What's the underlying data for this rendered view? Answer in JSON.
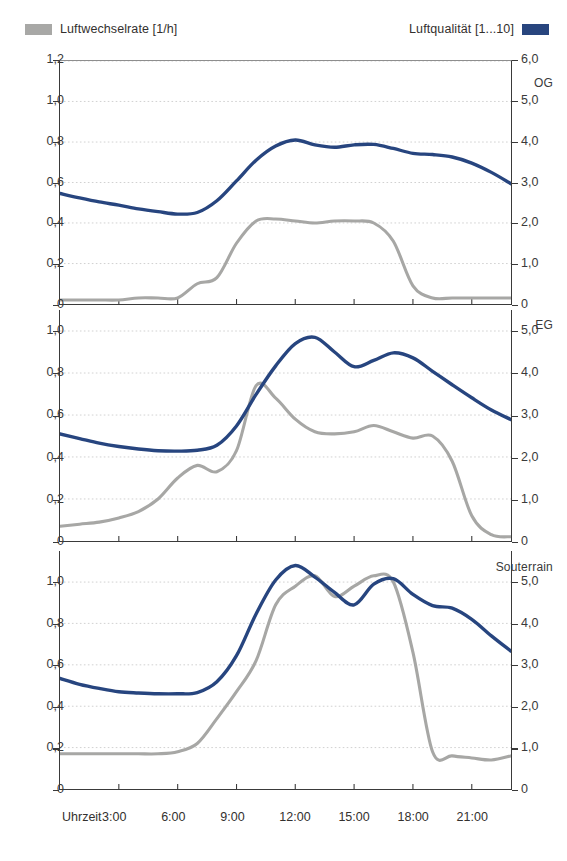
{
  "legend": {
    "left": {
      "label": "Luftwechselrate [1/h]",
      "color": "#a8a8a6",
      "swatch_name": "grey-swatch"
    },
    "right": {
      "label": "Luftqualität [1...10]",
      "color": "#28457e",
      "swatch_name": "blue-swatch"
    }
  },
  "axis": {
    "x_title": "Uhrzeit",
    "x_ticklabels": [
      "3:00",
      "6:00",
      "9:00",
      "12:00",
      "15:00",
      "18:00",
      "21:00"
    ],
    "x_tickvalues": [
      3,
      6,
      9,
      12,
      15,
      18,
      21
    ],
    "left_ticklabels_full": [
      "1,2",
      "1,0",
      "0,8",
      "0,6",
      "0,4",
      "0,2",
      "0"
    ],
    "left_tickvalues_full": [
      1.2,
      1.0,
      0.8,
      0.6,
      0.4,
      0.2,
      0
    ],
    "left_ticklabels_short": [
      "1,0",
      "0,8",
      "0,6",
      "0,4",
      "0,2",
      "0"
    ],
    "left_tickvalues_short": [
      1.0,
      0.8,
      0.6,
      0.4,
      0.2,
      0
    ],
    "right_ticklabels": [
      "6,0",
      "5,0",
      "4,0",
      "3,0",
      "2,0",
      "1,0",
      "0"
    ],
    "right_tickvalues": [
      6,
      5,
      4,
      3,
      2,
      1,
      0
    ]
  },
  "chart_data": {
    "type": "line",
    "title": "",
    "subtitle": "",
    "xlabel": "Uhrzeit",
    "ylabel": "Luftwechselrate [1/h]",
    "y2label": "Luftqualität [1...10]",
    "grid": true,
    "legend_position": "top",
    "xlim": [
      0,
      23
    ],
    "xticks": [
      3,
      6,
      9,
      12,
      15,
      18,
      21
    ],
    "xticklabels": [
      "3:00",
      "6:00",
      "9:00",
      "12:00",
      "15:00",
      "18:00",
      "21:00"
    ],
    "x": [
      0,
      1,
      2,
      3,
      4,
      5,
      6,
      7,
      8,
      9,
      10,
      11,
      12,
      13,
      14,
      15,
      16,
      17,
      18,
      19,
      20,
      21,
      22,
      23
    ],
    "panels": [
      {
        "name": "OG",
        "ylim": [
          0,
          1.2
        ],
        "y2lim": [
          0,
          6.0
        ],
        "yticks": [
          0,
          0.2,
          0.4,
          0.6,
          0.8,
          1.0,
          1.2
        ],
        "y2ticks": [
          0,
          1,
          2,
          3,
          4,
          5,
          6
        ],
        "series": [
          {
            "name": "Luftwechselrate [1/h]",
            "axis": "left",
            "color": "#a7a7a5",
            "values": [
              0.02,
              0.02,
              0.02,
              0.02,
              0.03,
              0.03,
              0.03,
              0.1,
              0.13,
              0.3,
              0.41,
              0.42,
              0.41,
              0.4,
              0.41,
              0.41,
              0.4,
              0.31,
              0.09,
              0.03,
              0.03,
              0.03,
              0.03,
              0.03
            ]
          },
          {
            "name": "Luftqualität [1...10]",
            "axis": "right",
            "color": "#27457f",
            "values": [
              2.73,
              2.62,
              2.52,
              2.44,
              2.35,
              2.28,
              2.22,
              2.26,
              2.55,
              3.04,
              3.55,
              3.9,
              4.05,
              3.93,
              3.87,
              3.93,
              3.94,
              3.84,
              3.72,
              3.69,
              3.63,
              3.48,
              3.25,
              2.97
            ]
          }
        ]
      },
      {
        "name": "EG",
        "ylim": [
          0,
          1.1
        ],
        "y2lim": [
          0,
          5.5
        ],
        "yticks": [
          0,
          0.2,
          0.4,
          0.6,
          0.8,
          1.0
        ],
        "y2ticks": [
          0,
          1,
          2,
          3,
          4,
          5
        ],
        "series": [
          {
            "name": "Luftwechselrate [1/h]",
            "axis": "left",
            "color": "#a7a7a5",
            "values": [
              0.07,
              0.08,
              0.09,
              0.11,
              0.14,
              0.2,
              0.3,
              0.36,
              0.33,
              0.43,
              0.74,
              0.68,
              0.58,
              0.52,
              0.51,
              0.52,
              0.55,
              0.52,
              0.49,
              0.5,
              0.38,
              0.12,
              0.03,
              0.02
            ]
          },
          {
            "name": "Luftqualität [1...10]",
            "axis": "right",
            "color": "#27457f",
            "values": [
              2.55,
              2.44,
              2.33,
              2.25,
              2.19,
              2.15,
              2.14,
              2.16,
              2.28,
              2.74,
              3.49,
              4.17,
              4.7,
              4.85,
              4.5,
              4.15,
              4.3,
              4.48,
              4.36,
              4.04,
              3.72,
              3.41,
              3.12,
              2.89
            ]
          }
        ]
      },
      {
        "name": "Souterrain",
        "ylim": [
          0,
          1.15
        ],
        "y2lim": [
          0,
          5.75
        ],
        "yticks": [
          0,
          0.2,
          0.4,
          0.6,
          0.8,
          1.0
        ],
        "y2ticks": [
          0,
          1,
          2,
          3,
          4,
          5
        ],
        "series": [
          {
            "name": "Luftwechselrate [1/h]",
            "axis": "left",
            "color": "#a7a7a5",
            "values": [
              0.17,
              0.17,
              0.17,
              0.17,
              0.17,
              0.17,
              0.18,
              0.22,
              0.34,
              0.47,
              0.62,
              0.89,
              0.98,
              1.03,
              0.93,
              0.98,
              1.03,
              1.0,
              0.66,
              0.18,
              0.16,
              0.15,
              0.14,
              0.16
            ]
          },
          {
            "name": "Luftqualität [1...10]",
            "axis": "right",
            "color": "#27457f",
            "values": [
              2.67,
              2.53,
              2.43,
              2.35,
              2.32,
              2.3,
              2.3,
              2.33,
              2.59,
              3.22,
              4.23,
              5.05,
              5.4,
              5.12,
              4.75,
              4.45,
              4.95,
              5.08,
              4.7,
              4.43,
              4.37,
              4.1,
              3.7,
              3.33,
              2.93
            ]
          }
        ]
      }
    ]
  },
  "panels": [
    {
      "title": "OG"
    },
    {
      "title": "EG"
    },
    {
      "title": "Souterrain"
    }
  ]
}
